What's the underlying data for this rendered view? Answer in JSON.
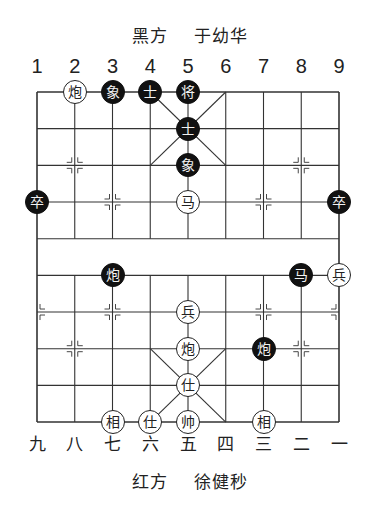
{
  "black_side": {
    "label": "黑方",
    "player": "于幼华"
  },
  "red_side": {
    "label": "红方",
    "player": "徐健秒"
  },
  "top_files": [
    "1",
    "2",
    "3",
    "4",
    "5",
    "6",
    "7",
    "8",
    "9"
  ],
  "bottom_files": [
    "九",
    "八",
    "七",
    "六",
    "五",
    "四",
    "三",
    "二",
    "一"
  ],
  "board": {
    "origin_x": 37,
    "origin_y": 92,
    "col_step": 37.75,
    "row_step": 36.67,
    "line_color": "#333333",
    "pieces": [
      {
        "side": "red",
        "char": "炮",
        "col": 1,
        "row": 0
      },
      {
        "side": "black",
        "char": "象",
        "col": 2,
        "row": 0
      },
      {
        "side": "black",
        "char": "士",
        "col": 3,
        "row": 0
      },
      {
        "side": "black",
        "char": "将",
        "col": 4,
        "row": 0
      },
      {
        "side": "black",
        "char": "士",
        "col": 4,
        "row": 1
      },
      {
        "side": "black",
        "char": "象",
        "col": 4,
        "row": 2
      },
      {
        "side": "black",
        "char": "卒",
        "col": 0,
        "row": 3
      },
      {
        "side": "red",
        "char": "马",
        "col": 4,
        "row": 3
      },
      {
        "side": "black",
        "char": "卒",
        "col": 8,
        "row": 3
      },
      {
        "side": "black",
        "char": "炮",
        "col": 2,
        "row": 5
      },
      {
        "side": "black",
        "char": "马",
        "col": 7,
        "row": 5
      },
      {
        "side": "red",
        "char": "兵",
        "col": 8,
        "row": 5
      },
      {
        "side": "red",
        "char": "兵",
        "col": 4,
        "row": 6
      },
      {
        "side": "red",
        "char": "炮",
        "col": 4,
        "row": 7
      },
      {
        "side": "black",
        "char": "炮",
        "col": 6,
        "row": 7
      },
      {
        "side": "red",
        "char": "仕",
        "col": 4,
        "row": 8
      },
      {
        "side": "red",
        "char": "相",
        "col": 2,
        "row": 9
      },
      {
        "side": "red",
        "char": "仕",
        "col": 3,
        "row": 9
      },
      {
        "side": "red",
        "char": "帅",
        "col": 4,
        "row": 9
      },
      {
        "side": "red",
        "char": "相",
        "col": 6,
        "row": 9
      }
    ],
    "markers": [
      {
        "col": 1,
        "row": 2
      },
      {
        "col": 7,
        "row": 2
      },
      {
        "col": 2,
        "row": 3
      },
      {
        "col": 6,
        "row": 3
      },
      {
        "col": 0,
        "row": 6
      },
      {
        "col": 2,
        "row": 6
      },
      {
        "col": 6,
        "row": 6
      },
      {
        "col": 8,
        "row": 6
      },
      {
        "col": 1,
        "row": 7
      },
      {
        "col": 7,
        "row": 7
      }
    ]
  }
}
